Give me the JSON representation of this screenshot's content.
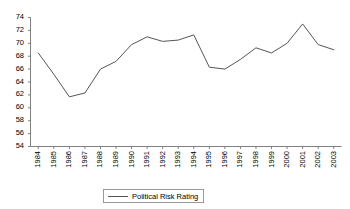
{
  "chart_data": {
    "type": "line",
    "title": "",
    "xlabel": "",
    "ylabel": "",
    "categories": [
      "1984",
      "1985",
      "1986",
      "1987",
      "1988",
      "1989",
      "1990",
      "1991",
      "1992",
      "1993",
      "1994",
      "1995",
      "1996",
      "1997",
      "1998",
      "1999",
      "2000",
      "2001",
      "2002",
      "2003"
    ],
    "series": [
      {
        "name": "Political Risk Rating",
        "color": "#555555",
        "values": [
          68.5,
          65.2,
          61.7,
          62.3,
          66.0,
          67.2,
          69.8,
          71.0,
          70.3,
          70.5,
          71.3,
          66.3,
          66.0,
          67.5,
          69.3,
          68.5,
          70.0,
          73.0,
          69.8,
          69.0
        ]
      }
    ],
    "ylim": [
      54,
      74
    ],
    "ytick_step": 2,
    "ytick_labels": [
      "74",
      "72",
      "70",
      "68",
      "66",
      "64",
      "62",
      "60",
      "58",
      "56",
      "54"
    ],
    "grid": false,
    "legend_position": "bottom-center",
    "legend_entries": [
      "Political Risk Rating"
    ]
  },
  "legend": {
    "label": "Political Risk Rating"
  },
  "axes": {
    "axis_color": "#808080",
    "line_color": "#555555"
  }
}
